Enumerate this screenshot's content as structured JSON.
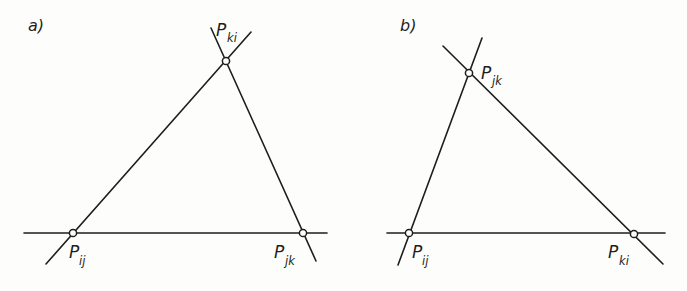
{
  "figure": {
    "colors": {
      "line": "#1e1e1e",
      "background": "#fdfdfb",
      "point_fill": "#ffffff"
    }
  },
  "panels": [
    {
      "id": "a",
      "label": "a)",
      "points": [
        {
          "name": "P_ij",
          "main": "P",
          "sub": "ij"
        },
        {
          "name": "P_ki",
          "main": "P",
          "sub": "ki"
        },
        {
          "name": "P_jk",
          "main": "P",
          "sub": "jk"
        }
      ]
    },
    {
      "id": "b",
      "label": "b)",
      "points": [
        {
          "name": "P_ij",
          "main": "P",
          "sub": "ij"
        },
        {
          "name": "P_jk",
          "main": "P",
          "sub": "jk"
        },
        {
          "name": "P_ki",
          "main": "P",
          "sub": "ki"
        }
      ]
    }
  ]
}
